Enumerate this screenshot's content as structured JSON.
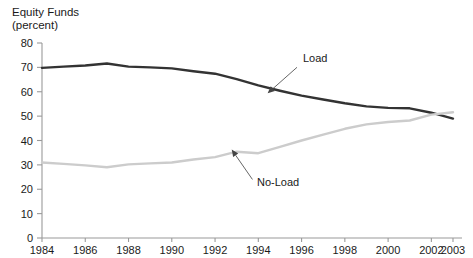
{
  "chart_data": {
    "type": "line",
    "title": "Equity Funds",
    "subtitle": "(percent)",
    "xlabel": "",
    "ylabel": "",
    "ylim": [
      0,
      80
    ],
    "ytick_step": 10,
    "yticks": [
      0,
      10,
      20,
      30,
      40,
      50,
      60,
      70,
      80
    ],
    "xlim": [
      1984,
      2003
    ],
    "xticks": [
      1984,
      1986,
      1988,
      1990,
      1992,
      1994,
      1996,
      1998,
      2000,
      2002,
      2003
    ],
    "xtick_labels": [
      "1984",
      "1986",
      "1988",
      "1990",
      "1992",
      "1994",
      "1996",
      "1998",
      "2000",
      "2002",
      "2003"
    ],
    "grid": false,
    "legend": "annotations",
    "x": [
      1984,
      1985,
      1986,
      1987,
      1988,
      1989,
      1990,
      1991,
      1992,
      1993,
      1994,
      1995,
      1996,
      1997,
      1998,
      1999,
      2000,
      2001,
      2002,
      2003
    ],
    "series": [
      {
        "name": "Load",
        "color": "#333333",
        "values": [
          69.8,
          70.3,
          70.8,
          71.6,
          70.3,
          70.0,
          69.6,
          68.4,
          67.4,
          65.2,
          62.6,
          60.4,
          58.4,
          56.8,
          55.3,
          54.0,
          53.4,
          53.2,
          51.4,
          49.0
        ]
      },
      {
        "name": "No-Load",
        "color": "#cccccc",
        "values": [
          31.0,
          30.4,
          29.8,
          29.0,
          30.2,
          30.6,
          31.0,
          32.2,
          33.2,
          35.4,
          34.8,
          37.4,
          40.0,
          42.4,
          44.8,
          46.6,
          47.6,
          48.2,
          50.6,
          51.6
        ]
      }
    ],
    "annotations": [
      {
        "text": "Load",
        "series": "Load",
        "label_x": 303,
        "label_y": 62,
        "point_x": 268,
        "point_y": 93
      },
      {
        "text": "No-Load",
        "series": "No-Load",
        "label_x": 257,
        "label_y": 186,
        "point_x": 232,
        "point_y": 150
      }
    ]
  }
}
